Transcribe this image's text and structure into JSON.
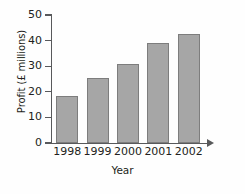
{
  "chart_data": {
    "type": "bar",
    "title": "",
    "xlabel": "Year",
    "ylabel": "Profit (£ millions)",
    "categories": [
      "1998",
      "1999",
      "2000",
      "2001",
      "2002"
    ],
    "values": [
      18.5,
      25.5,
      31,
      39,
      42.5
    ],
    "series": [
      {
        "name": "Profit",
        "values": [
          18.5,
          25.5,
          31,
          39,
          42.5
        ]
      }
    ],
    "ylim": [
      0,
      50
    ],
    "y_ticks": [
      0,
      10,
      20,
      30,
      40,
      50
    ],
    "y_tick_labels": [
      "0",
      "10",
      "20",
      "30",
      "40",
      "50"
    ],
    "grid": false,
    "legend": false,
    "bar_color": "#a6a6a6",
    "bar_border_color": "#7d7d7d",
    "axis_color": "#58595b",
    "background_color": "#fefefe",
    "x_axis_arrow": true
  }
}
